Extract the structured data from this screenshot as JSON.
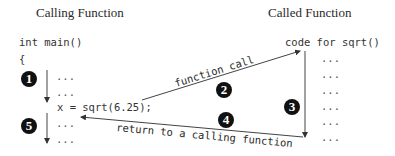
{
  "titles": {
    "calling": "Calling Function",
    "called": "Called Function"
  },
  "calling_code": {
    "header": "int main()",
    "brace": "{",
    "lines": [
      "...",
      "...",
      "x = sqrt(6.25);",
      "...",
      "..."
    ]
  },
  "called_code": {
    "header": "code for sqrt()",
    "lines": [
      "...",
      "...",
      "...",
      "...",
      "...",
      "..."
    ]
  },
  "arrows": {
    "call_label": "function call",
    "return_label": "return to a calling function"
  },
  "steps": [
    "1",
    "2",
    "3",
    "4",
    "5"
  ]
}
